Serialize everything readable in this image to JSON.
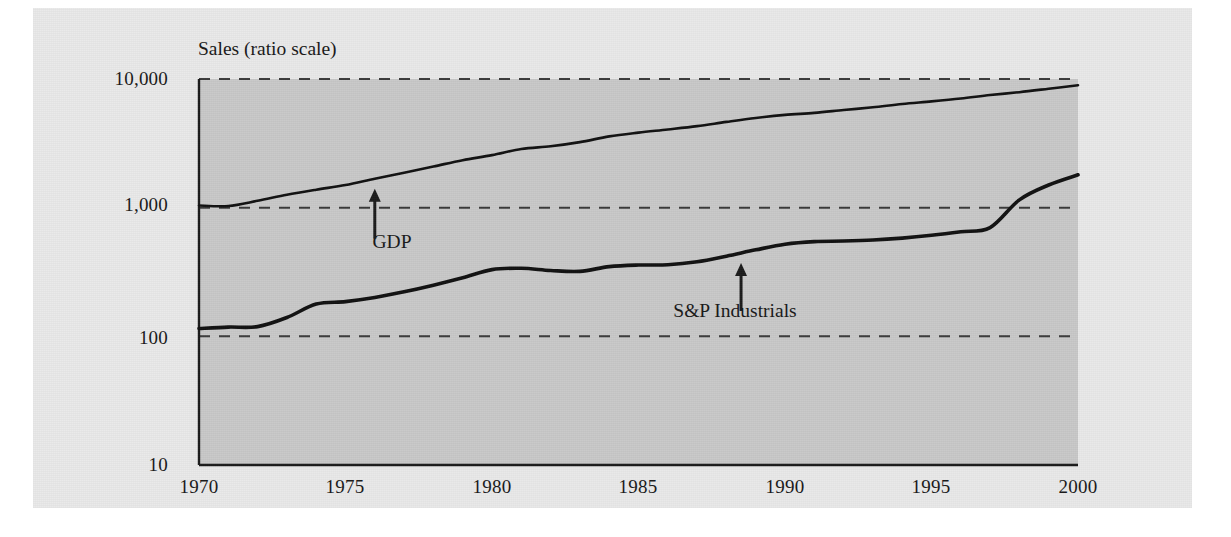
{
  "figure": {
    "background_color": "#e9e9e9",
    "plot_background_color": "#c9c9c9",
    "axis_color": "#1b1b1b",
    "gridline_color": "#3a3a3a",
    "line_color": "#111111"
  },
  "chart_data": {
    "type": "line",
    "title": "",
    "ylabel": "Sales (ratio scale)",
    "xlabel": "",
    "yscale": "log",
    "ylim": [
      10,
      10000
    ],
    "xlim": [
      1970,
      2000
    ],
    "grid": true,
    "gridlines_y": [
      10000,
      1000,
      100
    ],
    "legend_position": "inline-annotations",
    "ytick_labels": [
      "10,000",
      "1,000",
      "100",
      "10"
    ],
    "ytick_values": [
      10000,
      1000,
      100,
      10
    ],
    "xtick_labels": [
      "1970",
      "1975",
      "1980",
      "1985",
      "1990",
      "1995",
      "2000"
    ],
    "xtick_values": [
      1970,
      1975,
      1980,
      1985,
      1990,
      1995,
      2000
    ],
    "annotations": [
      {
        "text": "GDP",
        "x": 1976,
        "arrow": "up",
        "points_to_series": "GDP"
      },
      {
        "text": "S&P Industrials",
        "x": 1988.5,
        "arrow": "up",
        "points_to_series": "S&P Industrials"
      }
    ],
    "x": [
      1970,
      1971,
      1972,
      1973,
      1974,
      1975,
      1976,
      1977,
      1978,
      1979,
      1980,
      1981,
      1982,
      1983,
      1984,
      1985,
      1986,
      1987,
      1988,
      1989,
      1990,
      1991,
      1992,
      1993,
      1994,
      1995,
      1996,
      1997,
      1998,
      1999,
      2000
    ],
    "series": [
      {
        "name": "GDP",
        "values": [
          1040,
          1030,
          1130,
          1260,
          1380,
          1500,
          1680,
          1870,
          2090,
          2340,
          2560,
          2860,
          3000,
          3230,
          3580,
          3830,
          4050,
          4300,
          4640,
          4980,
          5260,
          5450,
          5740,
          6030,
          6400,
          6700,
          7050,
          7500,
          7900,
          8400,
          8950
        ]
      },
      {
        "name": "S&P Industrials",
        "values": [
          115,
          118,
          119,
          140,
          178,
          186,
          200,
          222,
          250,
          285,
          330,
          338,
          325,
          320,
          348,
          358,
          360,
          380,
          420,
          470,
          520,
          545,
          550,
          560,
          580,
          610,
          650,
          700,
          1150,
          1500,
          1800
        ]
      }
    ]
  }
}
